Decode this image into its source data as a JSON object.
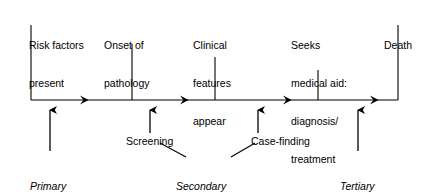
{
  "diagram": {
    "colors": {
      "ink": "#000000",
      "background": "#ffffff"
    },
    "axis": {
      "name": "disease-progression-timeline",
      "y": 100,
      "x_start": 31,
      "x_end": 398,
      "arrow_marker_positions": [
        88,
        188,
        291,
        378
      ]
    },
    "milestones": [
      {
        "id": "risk-factors",
        "lines": [
          "Risk factors",
          "present"
        ],
        "tick_x": 31,
        "tick_top": 25,
        "label_x": 29,
        "label_y": 14
      },
      {
        "id": "onset-of-pathology",
        "lines": [
          "Onset of",
          "pathology"
        ],
        "tick_x": 132,
        "tick_top": 44,
        "label_x": 104,
        "label_y": 14
      },
      {
        "id": "clinical-features-appear",
        "lines": [
          "Clinical",
          "features",
          "appear"
        ],
        "tick_x": 215,
        "tick_top": 57,
        "label_x": 193,
        "label_y": 14
      },
      {
        "id": "seeks-medical-aid",
        "lines": [
          "Seeks",
          "medical aid:",
          "diagnosis/",
          "treatment"
        ],
        "tick_x": 318,
        "tick_top": 70,
        "label_x": 291,
        "label_y": 14
      },
      {
        "id": "death",
        "lines": [
          "Death"
        ],
        "tick_x": 398,
        "tick_top": 25,
        "label_x": 384,
        "label_y": 14
      }
    ],
    "interventions": [
      {
        "id": "screening",
        "label": "Screening",
        "arrow_x": 150,
        "arrow_top": 108,
        "arrow_bottom": 133,
        "label_x": 126,
        "label_y": 135
      },
      {
        "id": "case-finding",
        "label": "Case-finding",
        "arrow_x": 258,
        "arrow_top": 108,
        "arrow_bottom": 133,
        "label_x": 251,
        "label_y": 135
      }
    ],
    "prevention_levels": [
      {
        "id": "primary-prevention",
        "emphasis": "Primary",
        "rest": "prevention",
        "arrow_x": 50,
        "arrow_top": 108,
        "arrow_bottom": 151,
        "label_x": 30,
        "label_y": 155
      },
      {
        "id": "secondary-prevention",
        "emphasis": "Secondary",
        "rest": "prevention",
        "arrow_x": null,
        "arrow_top": null,
        "arrow_bottom": null,
        "label_x": 176,
        "label_y": 155
      },
      {
        "id": "tertiary-prevention",
        "emphasis": "Tertiary",
        "rest": "prevention",
        "arrow_x": 358,
        "arrow_top": 108,
        "arrow_bottom": 151,
        "label_x": 340,
        "label_y": 155
      }
    ],
    "connectors": [
      {
        "id": "screening-to-secondary",
        "x1": 160,
        "y1": 143,
        "x2": 186,
        "y2": 157
      },
      {
        "id": "case-finding-to-secondary",
        "x1": 255,
        "y1": 143,
        "x2": 231,
        "y2": 157
      }
    ]
  }
}
